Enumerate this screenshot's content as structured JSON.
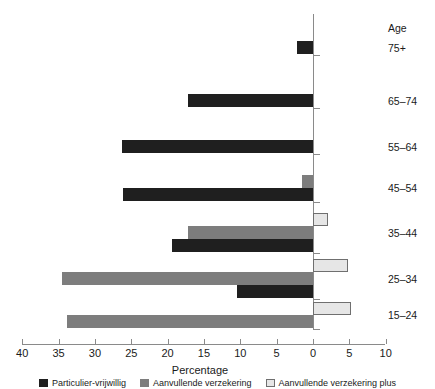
{
  "chart_data": {
    "type": "bar",
    "orientation": "horizontal",
    "title": "",
    "xlabel": "Percentage",
    "ylabel": "Age",
    "categories": [
      "75+",
      "65–74",
      "55–64",
      "45–54",
      "35–44",
      "25–34",
      "15–24"
    ],
    "xlim": [
      -40,
      10
    ],
    "xticks": [
      40,
      35,
      30,
      25,
      20,
      15,
      10,
      5,
      0,
      5,
      10
    ],
    "xtick_labels": [
      "40",
      "35",
      "30",
      "25",
      "20",
      "15",
      "10",
      "5",
      "0",
      "5",
      "10"
    ],
    "grid": false,
    "legend_position": "bottom",
    "note": "Values left of zero are plotted as negative magnitudes; axis labels are shown unsigned.",
    "series": [
      {
        "name": "Particulier-vrijwillig",
        "color": "#1f1f1f",
        "shade": "dark",
        "values": [
          -2.2,
          -17.2,
          -26.3,
          -26.2,
          -19.4,
          -10.5,
          0.0
        ]
      },
      {
        "name": "Aanvullende verzekering",
        "color": "#7d7d7d",
        "shade": "medium",
        "values": [
          0.0,
          0.0,
          0.0,
          -1.5,
          -17.2,
          -34.5,
          -33.8
        ]
      },
      {
        "name": "Aanvullende verzekering plus",
        "color": "#e6e6e6",
        "shade": "light",
        "values": [
          0.0,
          0.0,
          0.0,
          0.0,
          2.0,
          4.8,
          5.2
        ]
      }
    ]
  },
  "axis": {
    "x_title": "Percentage",
    "y_header": "Age",
    "tick_labels": [
      "40",
      "35",
      "30",
      "25",
      "20",
      "15",
      "10",
      "5",
      "0",
      "5",
      "10"
    ]
  },
  "categories": {
    "header": "Age",
    "items": [
      "75+",
      "65–74",
      "55–64",
      "45–54",
      "35–44",
      "25–34",
      "15–24"
    ]
  },
  "legend": {
    "items": [
      {
        "label": "Particulier-vrijwillig",
        "shade": "dark"
      },
      {
        "label": "Aanvullende verzekering",
        "shade": "medium"
      },
      {
        "label": "Aanvullende verzekering plus",
        "shade": "light"
      }
    ]
  },
  "colors": {
    "dark": "#1f1f1f",
    "medium": "#7d7d7d",
    "light": "#e6e6e6",
    "axis": "#8a8a8a",
    "text": "#1a1a1a",
    "background": "#ffffff"
  }
}
